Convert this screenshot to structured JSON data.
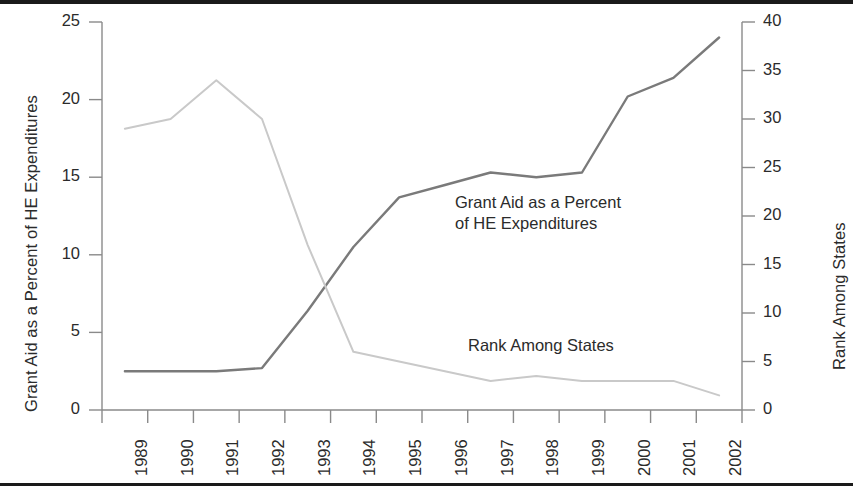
{
  "chart_data": {
    "type": "line",
    "title": "",
    "xlabel": "",
    "categories": [
      "1989",
      "1990",
      "1991",
      "1992",
      "1993",
      "1994",
      "1995",
      "1996",
      "1997",
      "1998",
      "1999",
      "2000",
      "2001",
      "2002"
    ],
    "axes": {
      "left": {
        "label": "Grant Aid as a Percent of HE Expenditures",
        "ticks": [
          0,
          5,
          10,
          15,
          20,
          25
        ],
        "lim": [
          0,
          25
        ]
      },
      "right": {
        "label": "Rank Among States",
        "ticks": [
          0,
          5,
          10,
          15,
          20,
          25,
          30,
          35,
          40
        ],
        "lim": [
          0,
          40
        ]
      }
    },
    "grid": false,
    "legend_position": "inline-annotations",
    "series": [
      {
        "name": "Grant Aid as a Percent of HE Expenditures",
        "axis": "left",
        "color": "#7a7a7a",
        "annotation": "Grant Aid as a Percent\nof HE Expenditures",
        "values": [
          2.5,
          2.5,
          2.5,
          2.7,
          6.4,
          10.5,
          13.7,
          14.5,
          15.3,
          15.0,
          15.3,
          20.2,
          21.4,
          24.0
        ]
      },
      {
        "name": "Rank Among States",
        "axis": "right",
        "color": "#c9c9c9",
        "annotation": "Rank Among States",
        "values": [
          29,
          30,
          34,
          30,
          17,
          6,
          5,
          4,
          3,
          3.5,
          3,
          3,
          3,
          1.5
        ]
      }
    ]
  },
  "annotations": {
    "grant_aid_note": "Grant Aid as a Percent\nof HE Expenditures",
    "rank_note": "Rank Among States"
  }
}
